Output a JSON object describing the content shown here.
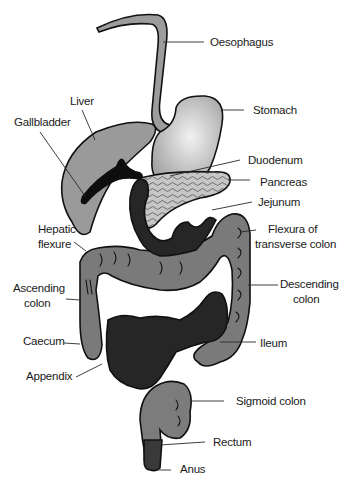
{
  "figure": {
    "colors": {
      "background": "#ffffff",
      "liver": "#9a9a9a",
      "stomach_light": "#eeeeee",
      "stomach_dark": "#a8a8a8",
      "oesophagus": "#9c9c9c",
      "pancreas": "#c4c4c4",
      "small_intestine": "#262626",
      "large_intestine": "#7a7a7a",
      "rectum": "#8a8a8a",
      "anus": "#3a3a3a",
      "outline": "#111111"
    },
    "labels": {
      "oesophagus": "Oesophagus",
      "liver": "Liver",
      "stomach": "Stomach",
      "gallbladder": "Gallbladder",
      "duodenum": "Duodenum",
      "pancreas": "Pancreas",
      "jejunum": "Jejunum",
      "hepatic_flexure_1": "Hepatic",
      "hepatic_flexure_2": "flexure",
      "flexura_1": "Flexura of",
      "flexura_2": "transverse colon",
      "ascending_1": "Ascending",
      "ascending_2": "colon",
      "descending_1": "Descending",
      "descending_2": "colon",
      "caecum": "Caecum",
      "ileum": "Ileum",
      "appendix": "Appendix",
      "sigmoid": "Sigmoid colon",
      "rectum": "Rectum",
      "anus": "Anus"
    }
  }
}
